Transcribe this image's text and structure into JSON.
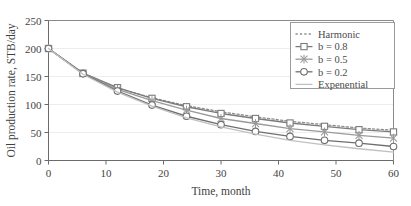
{
  "chart_data": {
    "type": "line",
    "title": "",
    "xlabel": "Time, month",
    "ylabel": "Oil production rate, STB/day",
    "xlim": [
      0,
      60
    ],
    "ylim": [
      0,
      250
    ],
    "xticks": [
      0,
      10,
      20,
      30,
      40,
      50,
      60
    ],
    "yticks": [
      0,
      50,
      100,
      150,
      200,
      250
    ],
    "xtick_labels": [
      "0",
      "10",
      "20",
      "30",
      "40",
      "50",
      "60"
    ],
    "ytick_labels": [
      "0",
      "50",
      "100",
      "150",
      "200",
      "250"
    ],
    "grid": "horizontal",
    "legend_position": "upper right",
    "x": [
      0,
      6,
      12,
      18,
      24,
      30,
      36,
      42,
      48,
      54,
      60
    ],
    "series": [
      {
        "name": "Harmonic",
        "style": "dotted",
        "marker": "none",
        "color": "#8d8d8d",
        "values": [
          200,
          156,
          129,
          112,
          98,
          87,
          78,
          70,
          64,
          58,
          54
        ]
      },
      {
        "name": "b = 0.8",
        "style": "solid",
        "marker": "square",
        "color": "#7b7b7b",
        "values": [
          200,
          156,
          130,
          111,
          96,
          84,
          75,
          67,
          61,
          55,
          51
        ]
      },
      {
        "name": "b = 0.5",
        "style": "solid",
        "marker": "star",
        "color": "#9a9a9a",
        "values": [
          200,
          155,
          127,
          107,
          90,
          75,
          66,
          57,
          51,
          45,
          40
        ]
      },
      {
        "name": "b = 0.2",
        "style": "solid",
        "marker": "circle",
        "color": "#6f6f6f",
        "values": [
          200,
          155,
          124,
          99,
          79,
          64,
          52,
          43,
          36,
          31,
          25
        ]
      },
      {
        "name": "Expenential",
        "style": "solid",
        "marker": "none",
        "color": "#c0c0c0",
        "values": [
          200,
          154,
          122,
          97,
          76,
          60,
          47,
          36,
          28,
          21,
          15
        ]
      }
    ]
  },
  "legend": {
    "entries": [
      {
        "label": "Harmonic"
      },
      {
        "label": "b = 0.8"
      },
      {
        "label": "b = 0.5"
      },
      {
        "label": "b = 0.2"
      },
      {
        "label": "Expenential"
      }
    ]
  },
  "colors": {
    "axis": "#6b6b6b",
    "grid": "#ededed",
    "plot_border": "#8a8a8a",
    "legend_border": "#9b9b9b",
    "text": "#3f3f3f"
  }
}
